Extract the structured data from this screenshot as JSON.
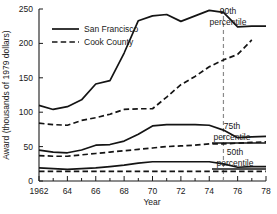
{
  "chart_data": {
    "type": "line",
    "title": "",
    "xlabel": "Year",
    "ylabel": "Award (thousands of 1979 dollars)",
    "xlim": [
      1962,
      1978
    ],
    "ylim": [
      0,
      250
    ],
    "xticks": [
      1962,
      1964,
      1966,
      1968,
      1970,
      1972,
      1974,
      1976,
      1978
    ],
    "xtick_labels": [
      "1962",
      "64",
      "66",
      "68",
      "70",
      "72",
      "74",
      "76",
      "78"
    ],
    "yticks": [
      0,
      50,
      100,
      150,
      200,
      250
    ],
    "ytick_labels": [
      "0",
      "50",
      "100",
      "150",
      "200",
      "250"
    ],
    "grid": false,
    "legend_position": "upper-left-inside",
    "annotations": [
      {
        "text": "90th percentile",
        "line1": "90th",
        "line2": "percentile",
        "value_at_end": 225
      },
      {
        "text": "75th percentile",
        "line1": "75th",
        "line2": "percentile",
        "value_at_end": 65
      },
      {
        "text": "50th percentile",
        "line1": "50th",
        "line2": "percentile",
        "value_at_end": 21
      }
    ],
    "reference_line": {
      "x": 1975,
      "style": "dashed",
      "color": "#8a8a8a"
    },
    "series": [
      {
        "name": "San Francisco",
        "percentile": "90th",
        "style": "solid",
        "x": [
          1962,
          1963,
          1964,
          1965,
          1966,
          1967,
          1968,
          1969,
          1970,
          1971,
          1972,
          1973,
          1974,
          1975,
          1976,
          1977,
          1978
        ],
        "values": [
          110,
          104,
          108,
          118,
          141,
          146,
          186,
          233,
          240,
          242,
          232,
          240,
          248,
          245,
          224,
          225,
          225
        ]
      },
      {
        "name": "Cook County",
        "percentile": "90th",
        "style": "dashed",
        "x": [
          1962,
          1963,
          1964,
          1965,
          1966,
          1967,
          1968,
          1969,
          1970,
          1971,
          1972,
          1973,
          1974,
          1975,
          1976,
          1977
        ],
        "values": [
          84,
          82,
          81,
          88,
          92,
          97,
          104,
          105,
          105,
          122,
          140,
          152,
          166,
          176,
          184,
          205
        ]
      },
      {
        "name": "San Francisco",
        "percentile": "75th",
        "style": "solid",
        "x": [
          1962,
          1963,
          1964,
          1965,
          1966,
          1967,
          1968,
          1969,
          1970,
          1971,
          1972,
          1973,
          1974,
          1975,
          1976,
          1977,
          1978
        ],
        "values": [
          45,
          42,
          41,
          45,
          52,
          53,
          58,
          68,
          80,
          82,
          82,
          82,
          81,
          74,
          63,
          64,
          65
        ]
      },
      {
        "name": "Cook County",
        "percentile": "75th",
        "style": "dashed",
        "x": [
          1962,
          1963,
          1964,
          1965,
          1966,
          1967,
          1968,
          1969,
          1970,
          1971,
          1972,
          1973,
          1974,
          1975,
          1976,
          1977,
          1978
        ],
        "values": [
          37,
          36,
          36,
          38,
          40,
          42,
          44,
          46,
          48,
          50,
          51,
          52,
          54,
          54,
          55,
          56,
          57
        ]
      },
      {
        "name": "San Francisco",
        "percentile": "50th",
        "style": "solid",
        "x": [
          1962,
          1963,
          1964,
          1965,
          1966,
          1967,
          1968,
          1969,
          1970,
          1971,
          1972,
          1973,
          1974,
          1975,
          1976,
          1977,
          1978
        ],
        "values": [
          19,
          18,
          17,
          18,
          19,
          21,
          23,
          26,
          28,
          28,
          28,
          28,
          28,
          25,
          20,
          21,
          21
        ]
      },
      {
        "name": "Cook County",
        "percentile": "50th",
        "style": "dashed",
        "x": [
          1962,
          1963,
          1964,
          1965,
          1966,
          1967,
          1968,
          1969,
          1970,
          1971,
          1972,
          1973,
          1974,
          1975,
          1976,
          1977,
          1978
        ],
        "values": [
          14,
          14,
          14,
          14,
          14,
          14,
          14,
          14,
          14,
          14,
          14,
          14,
          14,
          14,
          14,
          14,
          14
        ]
      }
    ],
    "legend": [
      {
        "label": "San Francisco",
        "style": "solid"
      },
      {
        "label": "Cook County",
        "style": "dashed"
      }
    ]
  }
}
